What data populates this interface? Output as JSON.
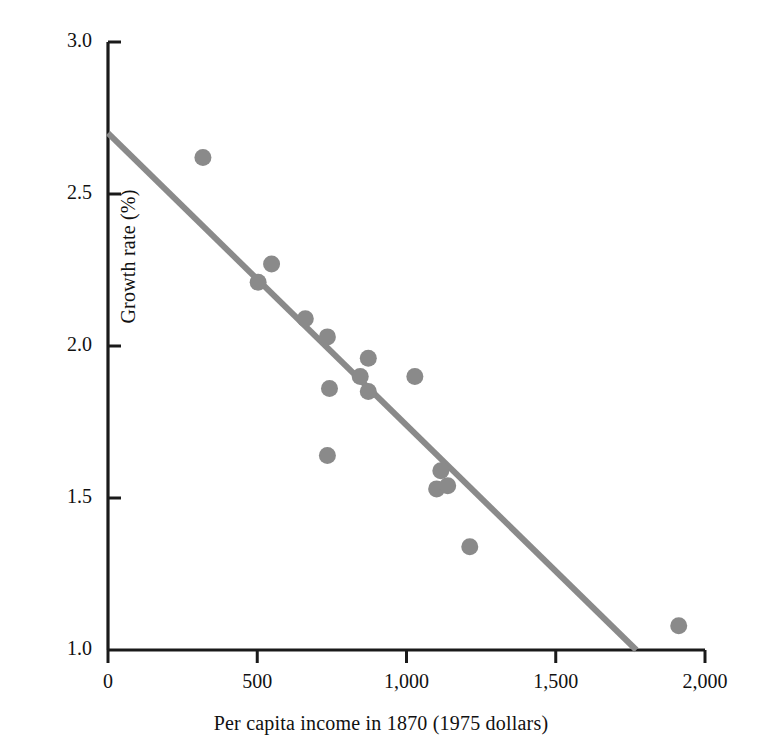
{
  "chart_data": {
    "type": "scatter",
    "title": "",
    "xlabel": "Per capita income in 1870 (1975 dollars)",
    "ylabel": "Growth rate (%)",
    "xlim": [
      0,
      2000
    ],
    "ylim": [
      1.0,
      3.0
    ],
    "xticks": [
      0,
      500,
      1000,
      1500,
      2000
    ],
    "xtick_labels": [
      "0",
      "500",
      "1,000",
      "1,500",
      "2,000"
    ],
    "yticks": [
      1.0,
      1.5,
      2.0,
      2.5,
      3.0
    ],
    "ytick_labels": [
      "1.0",
      "1.5",
      "2.0",
      "2.5",
      "3.0"
    ],
    "grid": false,
    "legend": false,
    "marker_color": "#8a8a8a",
    "line_color": "#8a8a8a",
    "axis_color": "#1a1a1a",
    "series": [
      {
        "name": "countries",
        "marker": "circle",
        "points": [
          {
            "x": 318,
            "y": 2.62
          },
          {
            "x": 503,
            "y": 2.21
          },
          {
            "x": 548,
            "y": 2.27
          },
          {
            "x": 661,
            "y": 2.09
          },
          {
            "x": 735,
            "y": 2.03
          },
          {
            "x": 742,
            "y": 1.86
          },
          {
            "x": 735,
            "y": 1.64
          },
          {
            "x": 845,
            "y": 1.9
          },
          {
            "x": 872,
            "y": 1.96
          },
          {
            "x": 872,
            "y": 1.85
          },
          {
            "x": 1028,
            "y": 1.9
          },
          {
            "x": 1115,
            "y": 1.59
          },
          {
            "x": 1101,
            "y": 1.53
          },
          {
            "x": 1138,
            "y": 1.54
          },
          {
            "x": 1212,
            "y": 1.34
          },
          {
            "x": 1912,
            "y": 1.08
          }
        ]
      }
    ],
    "trendline": {
      "name": "regression-line",
      "x_start": 0,
      "y_start": 2.7,
      "x_end": 1770,
      "y_end": 1.0
    }
  }
}
